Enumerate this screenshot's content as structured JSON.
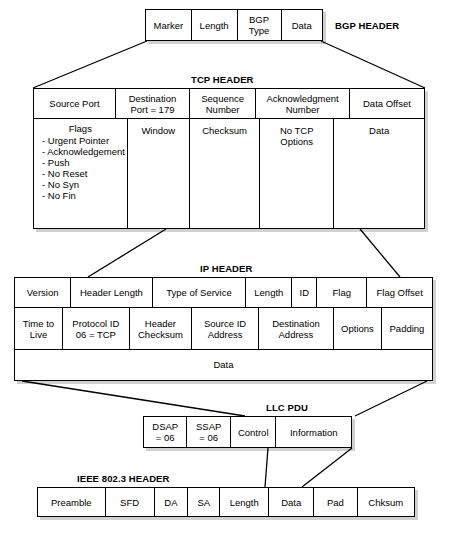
{
  "diagram": {
    "type": "protocol-encapsulation-diagram"
  },
  "layers": [
    {
      "id": "bgp",
      "caption": "BGP HEADER",
      "rows": [
        {
          "cells": [
            {
              "label": "Marker"
            },
            {
              "label": "Length"
            },
            {
              "label": "BGP\nType"
            },
            {
              "label": "Data"
            }
          ]
        }
      ]
    },
    {
      "id": "tcp",
      "caption": "TCP HEADER",
      "rows": [
        {
          "cells": [
            {
              "label": "Source Port"
            },
            {
              "label": "Destination\nPort = 179"
            },
            {
              "label": "Sequence\nNumber"
            },
            {
              "label": "Acknowledgment\nNumber"
            },
            {
              "label": "Data Offset"
            }
          ]
        },
        {
          "cells": [
            {
              "label": "Flags",
              "items": [
                "- Urgent Pointer",
                "- Acknowledgement",
                "- Push",
                "- No Reset",
                "- No Syn",
                "- No Fin"
              ]
            },
            {
              "label": "Window"
            },
            {
              "label": "Checksum"
            },
            {
              "label": "No TCP\nOptions"
            },
            {
              "label": "Data"
            }
          ]
        }
      ]
    },
    {
      "id": "ip",
      "caption": "IP HEADER",
      "rows": [
        {
          "cells": [
            {
              "label": "Version"
            },
            {
              "label": "Header Length"
            },
            {
              "label": "Type of Service"
            },
            {
              "label": "Length"
            },
            {
              "label": "ID"
            },
            {
              "label": "Flag"
            },
            {
              "label": "Flag Offset"
            }
          ]
        },
        {
          "cells": [
            {
              "label": "Time to\nLive"
            },
            {
              "label": "Protocol ID\n06 = TCP"
            },
            {
              "label": "Header\nChecksum"
            },
            {
              "label": "Source ID\nAddress"
            },
            {
              "label": "Destination\nAddress"
            },
            {
              "label": "Options"
            },
            {
              "label": "Padding"
            }
          ]
        },
        {
          "cells": [
            {
              "label": "Data"
            }
          ]
        }
      ]
    },
    {
      "id": "llc",
      "caption": "LLC PDU",
      "rows": [
        {
          "cells": [
            {
              "label": "DSAP\n= 06"
            },
            {
              "label": "SSAP\n= 06"
            },
            {
              "label": "Control"
            },
            {
              "label": "Information"
            }
          ]
        }
      ]
    },
    {
      "id": "mac",
      "caption": "IEEE 802.3 HEADER",
      "rows": [
        {
          "cells": [
            {
              "label": "Preamble"
            },
            {
              "label": "SFD"
            },
            {
              "label": "DA"
            },
            {
              "label": "SA"
            },
            {
              "label": "Length"
            },
            {
              "label": "Data"
            },
            {
              "label": "Pad"
            },
            {
              "label": "Chksum"
            }
          ]
        }
      ]
    }
  ],
  "colors": {
    "stroke": "#000000",
    "fill": "#ffffff",
    "shadow": "rgba(0,0,0,0.18)"
  }
}
